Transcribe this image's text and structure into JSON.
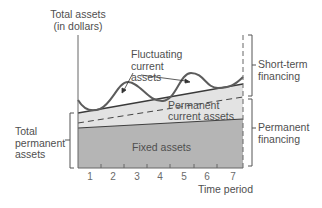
{
  "diagram": {
    "y_axis_label_line1": "Total assets",
    "y_axis_label_line2": "(in dollars)",
    "x_axis_label": "Time period",
    "x_ticks": [
      "1",
      "2",
      "3",
      "4",
      "5",
      "6",
      "7"
    ],
    "regions": {
      "fluctuating_line1": "Fluctuating",
      "fluctuating_line2": "current",
      "fluctuating_line3": "assets",
      "permanent_current_line1": "Permanent",
      "permanent_current_line2": "current assets",
      "fixed": "Fixed assets"
    },
    "left_bracket": {
      "line1": "Total",
      "line2": "permanent",
      "line3": "assets"
    },
    "right_brackets": {
      "short_term_line1": "Short-term",
      "short_term_line2": "financing",
      "permanent_line1": "Permanent",
      "permanent_line2": "financing"
    },
    "colors": {
      "fixed_fill": "#b3b3b3",
      "permanent_current_fill": "#e2e2e2",
      "wave_stroke": "#5a5a5a",
      "axis": "#555555"
    }
  }
}
